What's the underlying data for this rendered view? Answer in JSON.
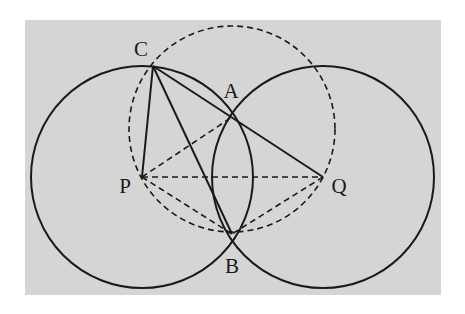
{
  "diagram": {
    "type": "geometry",
    "colors": {
      "page_background": "#ffffff",
      "panel_background": "#d5d5d5",
      "stroke": "#1a1a1a"
    },
    "panel": {
      "x": 25,
      "y": 20,
      "width": 416,
      "height": 275
    },
    "points": {
      "C": {
        "label": "C",
        "x": 153,
        "y": 66,
        "label_x": 141,
        "label_y": 56
      },
      "A": {
        "label": "A",
        "x": 232,
        "y": 117,
        "label_x": 231,
        "label_y": 98
      },
      "P": {
        "label": "P",
        "x": 142,
        "y": 177,
        "label_x": 125,
        "label_y": 193
      },
      "Q": {
        "label": "Q",
        "x": 323,
        "y": 177,
        "label_x": 339,
        "label_y": 193
      },
      "B": {
        "label": "B",
        "x": 232,
        "y": 234,
        "label_x": 232,
        "label_y": 273
      }
    },
    "circles": [
      {
        "name": "circle-P",
        "center": "P",
        "cx": 142,
        "cy": 177,
        "r": 111,
        "style": "solid"
      },
      {
        "name": "circle-Q",
        "center": "Q",
        "cx": 323,
        "cy": 177,
        "r": 111,
        "style": "solid"
      },
      {
        "name": "circumcircle-CPQ",
        "cx": 232,
        "cy": 129,
        "r": 103,
        "style": "dashed"
      }
    ],
    "segments": [
      {
        "name": "CP",
        "from": "C",
        "to": "P",
        "style": "solid"
      },
      {
        "name": "CB",
        "from": "C",
        "to": "B",
        "style": "solid"
      },
      {
        "name": "CQ",
        "from": "C",
        "to": "Q",
        "style": "solid",
        "passes_through": "A"
      },
      {
        "name": "PA",
        "from": "P",
        "to": "A",
        "style": "dashed"
      },
      {
        "name": "PQ",
        "from": "P",
        "to": "Q",
        "style": "dashed"
      },
      {
        "name": "PB",
        "from": "P",
        "to": "B",
        "style": "dashed"
      },
      {
        "name": "QB",
        "from": "Q",
        "to": "B",
        "style": "dashed"
      }
    ]
  }
}
